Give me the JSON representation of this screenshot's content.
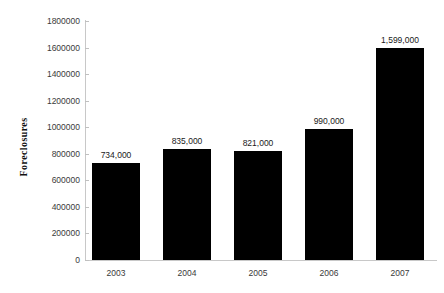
{
  "chart_data": {
    "type": "bar",
    "title": "",
    "xlabel": "",
    "ylabel": "Foreclosures",
    "categories": [
      "2003",
      "2004",
      "2005",
      "2006",
      "2007"
    ],
    "values": [
      734000,
      835000,
      821000,
      990000,
      1599000
    ],
    "data_labels": [
      "734,000",
      "835,000",
      "821,000",
      "990,000",
      "1,599,000"
    ],
    "ylim": [
      0,
      1800000
    ],
    "ytick_values": [
      0,
      200000,
      400000,
      600000,
      800000,
      1000000,
      1200000,
      1400000,
      1600000,
      1800000
    ],
    "ytick_labels": [
      "0",
      "200000",
      "400000",
      "600000",
      "800000",
      "1000000",
      "1200000",
      "1400000",
      "1600000",
      "1800000"
    ],
    "grid": false,
    "legend": null,
    "bar_color": "#000000",
    "axis_color": "#c8c8c8",
    "background": "#ffffff"
  }
}
